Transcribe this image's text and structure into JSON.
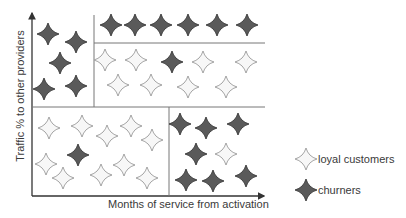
{
  "figure": {
    "y_axis_label": "Traffic % to other providers",
    "x_axis_label": "Months of service from activation"
  },
  "legend": {
    "items": [
      {
        "label": "loyal customers",
        "symbol": "light-star",
        "color": "#f4f4f4"
      },
      {
        "label": "churners",
        "symbol": "dark-star",
        "color": "#555555"
      }
    ]
  },
  "colors": {
    "axis": "#333333",
    "divider": "#777777",
    "loyal_fill": "#f7f7f7",
    "loyal_stroke": "#9a9a9a",
    "churner_fill": "#5a5a5a",
    "churner_stroke": "#3a3a3a"
  },
  "regions": [
    {
      "name": "high-traffic-short-tenure",
      "stars": [
        {
          "x": 48,
          "y": 34,
          "type": "churner"
        },
        {
          "x": 76,
          "y": 42,
          "type": "churner"
        },
        {
          "x": 60,
          "y": 63,
          "type": "churner"
        },
        {
          "x": 44,
          "y": 89,
          "type": "churner"
        },
        {
          "x": 76,
          "y": 86,
          "type": "churner"
        }
      ]
    },
    {
      "name": "top-row",
      "stars": [
        {
          "x": 111,
          "y": 25,
          "type": "churner"
        },
        {
          "x": 135,
          "y": 25,
          "type": "churner"
        },
        {
          "x": 161,
          "y": 25,
          "type": "churner"
        },
        {
          "x": 188,
          "y": 25,
          "type": "churner"
        },
        {
          "x": 217,
          "y": 25,
          "type": "churner"
        },
        {
          "x": 247,
          "y": 25,
          "type": "churner"
        }
      ]
    },
    {
      "name": "middle-right",
      "stars": [
        {
          "x": 105,
          "y": 60,
          "type": "loyal"
        },
        {
          "x": 136,
          "y": 60,
          "type": "loyal"
        },
        {
          "x": 172,
          "y": 62,
          "type": "churner"
        },
        {
          "x": 203,
          "y": 62,
          "type": "loyal"
        },
        {
          "x": 246,
          "y": 62,
          "type": "loyal"
        },
        {
          "x": 118,
          "y": 85,
          "type": "loyal"
        },
        {
          "x": 151,
          "y": 85,
          "type": "loyal"
        },
        {
          "x": 188,
          "y": 87,
          "type": "loyal"
        },
        {
          "x": 226,
          "y": 87,
          "type": "loyal"
        }
      ]
    },
    {
      "name": "bottom-left",
      "stars": [
        {
          "x": 49,
          "y": 128,
          "type": "loyal"
        },
        {
          "x": 82,
          "y": 126,
          "type": "loyal"
        },
        {
          "x": 107,
          "y": 136,
          "type": "loyal"
        },
        {
          "x": 131,
          "y": 126,
          "type": "loyal"
        },
        {
          "x": 152,
          "y": 140,
          "type": "loyal"
        },
        {
          "x": 78,
          "y": 155,
          "type": "churner"
        },
        {
          "x": 46,
          "y": 164,
          "type": "loyal"
        },
        {
          "x": 63,
          "y": 178,
          "type": "loyal"
        },
        {
          "x": 101,
          "y": 175,
          "type": "loyal"
        },
        {
          "x": 124,
          "y": 165,
          "type": "loyal"
        },
        {
          "x": 147,
          "y": 178,
          "type": "loyal"
        }
      ]
    },
    {
      "name": "bottom-right",
      "stars": [
        {
          "x": 180,
          "y": 124,
          "type": "churner"
        },
        {
          "x": 206,
          "y": 128,
          "type": "churner"
        },
        {
          "x": 238,
          "y": 124,
          "type": "churner"
        },
        {
          "x": 196,
          "y": 154,
          "type": "churner"
        },
        {
          "x": 226,
          "y": 154,
          "type": "loyal"
        },
        {
          "x": 186,
          "y": 180,
          "type": "churner"
        },
        {
          "x": 213,
          "y": 181,
          "type": "churner"
        },
        {
          "x": 246,
          "y": 176,
          "type": "churner"
        }
      ]
    }
  ]
}
